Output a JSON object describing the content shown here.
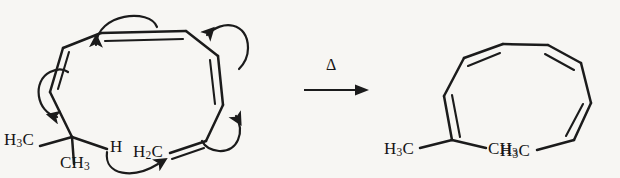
{
  "diagram": {
    "type": "chemical-reaction-mechanism",
    "background_color": "#f7f6f3",
    "line_color": "#1b1b1b"
  },
  "reactant": {
    "name": "cyclic-polyene-reactant",
    "labels": {
      "methyl_left": "H",
      "methyl_left_sub": "3",
      "methyl_left_tail": "C",
      "methyl_bottom": "CH",
      "methyl_bottom_sub": "3",
      "hydrogen": "H",
      "methylene": "H",
      "methylene_sub": "2",
      "methylene_tail": "C"
    }
  },
  "conditions": {
    "name": "reaction-conditions",
    "symbol": "Δ"
  },
  "product": {
    "name": "open-chain-polyene-product",
    "labels": {
      "methyl_left": "H",
      "methyl_left_sub": "3",
      "methyl_left_tail": "C",
      "methyl_right": "CH",
      "methyl_right_sub": "3",
      "methyl_terminal": "H",
      "methyl_terminal_sub": "3",
      "methyl_terminal_tail": "C"
    }
  },
  "electron_arrows": [
    {
      "id": "arrow-top-left",
      "description": "curved arrow over top-left diene, pointing down-left"
    },
    {
      "id": "arrow-top-right",
      "description": "curved arrow at top-right, pointing left"
    },
    {
      "id": "arrow-left",
      "description": "curved arrow at left, pointing down toward quaternary carbon"
    },
    {
      "id": "arrow-bottom-right",
      "description": "curved arrow at bottom-right, pointing up"
    },
    {
      "id": "arrow-bottom-center",
      "description": "curved arrow from hydrogen to terminal methylene, pointing right"
    }
  ]
}
